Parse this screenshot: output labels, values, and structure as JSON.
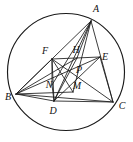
{
  "figure": {
    "kind": "circle-geometry-diagram",
    "colors": {
      "stroke": "#1a1a1a",
      "background": "#ffffff",
      "label": "#111111"
    },
    "circle": {
      "cx": 66,
      "cy": 72,
      "r": 58.5,
      "stroke_width": 1.15
    },
    "points": [
      {
        "id": "A",
        "label": "A",
        "x": 91,
        "y": 21,
        "label_x": 96,
        "label_y": 10,
        "on_circle": true
      },
      {
        "id": "B",
        "label": "B",
        "x": 16,
        "y": 94,
        "label_x": 8,
        "label_y": 98,
        "on_circle": true
      },
      {
        "id": "C",
        "label": "C",
        "x": 113,
        "y": 102,
        "label_x": 122,
        "label_y": 107,
        "on_circle": true
      },
      {
        "id": "D",
        "label": "D",
        "x": 54,
        "y": 101,
        "label_x": 53,
        "label_y": 112,
        "on_circle": false
      },
      {
        "id": "E",
        "label": "E",
        "x": 100,
        "y": 57,
        "label_x": 105,
        "label_y": 58,
        "on_circle": false
      },
      {
        "id": "F",
        "label": "F",
        "x": 52,
        "y": 59,
        "label_x": 45,
        "label_y": 52,
        "on_circle": false
      },
      {
        "id": "H",
        "label": "H",
        "x": 77,
        "y": 58,
        "label_x": 76,
        "label_y": 51,
        "on_circle": false
      },
      {
        "id": "M",
        "label": "M",
        "x": 73,
        "y": 92,
        "label_x": 77,
        "label_y": 87,
        "on_circle": false
      },
      {
        "id": "N",
        "label": "N",
        "x": 52,
        "y": 85,
        "label_x": 49,
        "label_y": 86,
        "on_circle": false
      },
      {
        "id": "P",
        "label": "P",
        "x": 76,
        "y": 72,
        "label_x": 79,
        "label_y": 71,
        "on_circle": false
      }
    ],
    "segments": [
      {
        "id": "seg-AB",
        "from": "A",
        "to": "B"
      },
      {
        "id": "seg-AC",
        "from": "A",
        "to": "C"
      },
      {
        "id": "seg-BC",
        "from": "B",
        "to": "C"
      },
      {
        "id": "seg-AD",
        "from": "A",
        "to": "D"
      },
      {
        "id": "seg-AN",
        "from": "A",
        "to": "N"
      },
      {
        "id": "seg-AM",
        "from": "A",
        "to": "M"
      },
      {
        "id": "seg-AH",
        "from": "A",
        "to": "H"
      },
      {
        "id": "seg-FE",
        "from": "F",
        "to": "E"
      },
      {
        "id": "seg-FD",
        "from": "F",
        "to": "D"
      },
      {
        "id": "seg-FN",
        "from": "F",
        "to": "N"
      },
      {
        "id": "seg-FC",
        "from": "F",
        "to": "C"
      },
      {
        "id": "seg-FM",
        "from": "F",
        "to": "M"
      },
      {
        "id": "seg-BF",
        "from": "B",
        "to": "F"
      },
      {
        "id": "seg-BE",
        "from": "B",
        "to": "E"
      },
      {
        "id": "seg-BH",
        "from": "B",
        "to": "H"
      },
      {
        "id": "seg-BD",
        "from": "B",
        "to": "D"
      },
      {
        "id": "seg-BM",
        "from": "B",
        "to": "M"
      },
      {
        "id": "seg-EC",
        "from": "E",
        "to": "C"
      },
      {
        "id": "seg-ED",
        "from": "E",
        "to": "D"
      },
      {
        "id": "seg-DC",
        "from": "D",
        "to": "C"
      },
      {
        "id": "seg-ND",
        "from": "N",
        "to": "D"
      },
      {
        "id": "seg-DH",
        "from": "D",
        "to": "H"
      }
    ]
  }
}
